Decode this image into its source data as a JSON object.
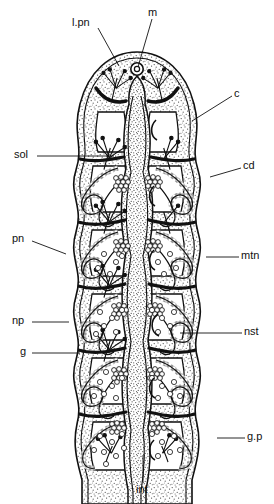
{
  "figure": {
    "kind": "anatomical-section-diagram",
    "background_color": "#ffffff",
    "ink_color": "#111111",
    "stipple_color": "#555555",
    "width_px": 274,
    "height_px": 504
  },
  "labels": [
    {
      "id": "l.pn",
      "text": "l.pn",
      "x": 72,
      "y": 17,
      "anchor": "start",
      "leader": {
        "x1": 98,
        "y1": 28,
        "x2": 119,
        "y2": 66
      }
    },
    {
      "id": "m",
      "text": "m",
      "x": 148,
      "y": 7,
      "anchor": "start",
      "leader": {
        "x1": 152,
        "y1": 19,
        "x2": 138,
        "y2": 67
      }
    },
    {
      "id": "c",
      "text": "c",
      "x": 234,
      "y": 88,
      "anchor": "start",
      "leader": {
        "x1": 232,
        "y1": 96,
        "x2": 192,
        "y2": 121
      }
    },
    {
      "id": "sol",
      "text": "sol",
      "x": 14,
      "y": 149,
      "anchor": "start",
      "leader": {
        "x1": 37,
        "y1": 156,
        "x2": 114,
        "y2": 156
      }
    },
    {
      "id": "cd",
      "text": "cd",
      "x": 243,
      "y": 160,
      "anchor": "start",
      "leader": {
        "x1": 241,
        "y1": 168,
        "x2": 210,
        "y2": 177
      }
    },
    {
      "id": "pn",
      "text": "pn",
      "x": 12,
      "y": 233,
      "anchor": "start",
      "leader": {
        "x1": 32,
        "y1": 241,
        "x2": 66,
        "y2": 254
      }
    },
    {
      "id": "mtn",
      "text": "mtn",
      "x": 241,
      "y": 250,
      "anchor": "start",
      "leader": {
        "x1": 239,
        "y1": 257,
        "x2": 206,
        "y2": 257
      }
    },
    {
      "id": "np",
      "text": "np",
      "x": 12,
      "y": 315,
      "anchor": "start",
      "leader": {
        "x1": 32,
        "y1": 322,
        "x2": 69,
        "y2": 322
      }
    },
    {
      "id": "nst",
      "text": "nst",
      "x": 244,
      "y": 326,
      "anchor": "start",
      "leader": {
        "x1": 242,
        "y1": 333,
        "x2": 180,
        "y2": 333
      }
    },
    {
      "id": "g",
      "text": "g",
      "x": 20,
      "y": 346,
      "anchor": "start",
      "leader": {
        "x1": 32,
        "y1": 353,
        "x2": 80,
        "y2": 353
      }
    },
    {
      "id": "g.p",
      "text": "g.p",
      "x": 247,
      "y": 431,
      "anchor": "start",
      "leader": {
        "x1": 245,
        "y1": 438,
        "x2": 217,
        "y2": 438
      }
    },
    {
      "id": "int",
      "text": "int",
      "x": 136,
      "y": 484,
      "anchor": "start",
      "leader": {
        "x1": 143,
        "y1": 482,
        "x2": 143,
        "y2": 455
      }
    }
  ],
  "structures": {
    "body_outline": "tapered dome anterior, wavy scalloped lateral walls, open posterior",
    "gut_label": "int",
    "mouth_label": "m",
    "segment_count": 6
  }
}
